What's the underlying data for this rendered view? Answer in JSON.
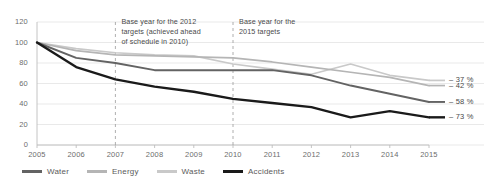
{
  "chart_data": {
    "type": "line",
    "title": "",
    "xlabel": "",
    "ylabel": "",
    "x": [
      2005,
      2006,
      2007,
      2008,
      2009,
      2010,
      2011,
      2012,
      2013,
      2014,
      2015
    ],
    "xticklabels": [
      "2005",
      "2006",
      "2007",
      "2008",
      "2009",
      "2010",
      "2011",
      "2012",
      "2013",
      "2014",
      "2015"
    ],
    "yticklabels": [
      "0",
      "20",
      "40",
      "60",
      "80",
      "100",
      "120"
    ],
    "yticks": [
      0,
      20,
      40,
      60,
      80,
      100,
      120
    ],
    "ylim": [
      0,
      120
    ],
    "xlim": [
      2005,
      2015
    ],
    "grid": "horizontal",
    "legend_position": "bottom",
    "series": [
      {
        "name": "Water",
        "color": "#636363",
        "width": 1.9,
        "values": [
          100,
          85,
          80,
          73,
          73,
          73,
          73,
          68,
          58,
          50,
          42
        ],
        "end_label": "– 58 %"
      },
      {
        "name": "Energy",
        "color": "#b5b5b5",
        "width": 1.7,
        "values": [
          100,
          92,
          88,
          87,
          86,
          85,
          81,
          76,
          71,
          66,
          58
        ],
        "end_label": "– 42 %"
      },
      {
        "name": "Waste",
        "color": "#c9c9c9",
        "width": 1.7,
        "values": [
          100,
          94,
          90,
          88,
          87,
          79,
          74,
          69,
          79,
          68,
          63
        ],
        "end_label": "– 37 %"
      },
      {
        "name": "Accidents",
        "color": "#1a1a1a",
        "width": 2.4,
        "values": [
          100,
          76,
          64,
          57,
          52,
          45,
          41,
          37,
          27,
          33,
          27
        ],
        "end_label": "– 73 %"
      }
    ],
    "annotations": [
      {
        "id": "base-year-2012",
        "text": "Base year for the 2012\ntargets (achieved ahead\nof schedule in 2010)",
        "marker_x": 2007
      },
      {
        "id": "base-year-2015",
        "text": "Base year for the\n2015 targets",
        "marker_x": 2010
      }
    ]
  },
  "legend": {
    "items": [
      {
        "label": "Water",
        "color": "#636363"
      },
      {
        "label": "Energy",
        "color": "#b5b5b5"
      },
      {
        "label": "Waste",
        "color": "#c9c9c9"
      },
      {
        "label": "Accidents",
        "color": "#1a1a1a"
      }
    ]
  }
}
